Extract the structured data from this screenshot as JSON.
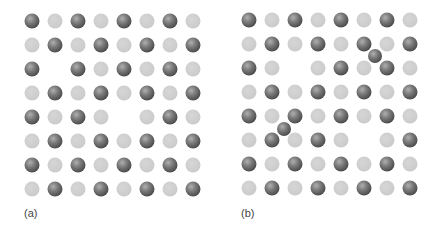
{
  "figure": {
    "colors": {
      "dark_atom": "#555555",
      "light_atom": "#cccccc",
      "background": "#ffffff"
    },
    "grid": {
      "rows": 8,
      "cols": 8,
      "pattern": "checkerboard: dark where (row+col) even"
    },
    "panels": [
      {
        "id": "a",
        "label": "(a)",
        "origin": [
          32,
          21
        ],
        "spacing": [
          23,
          24
        ],
        "vacancies": [
          [
            2,
            1
          ],
          [
            4,
            4
          ]
        ],
        "interstitials": [],
        "label_pos": [
          24,
          207
        ]
      },
      {
        "id": "b",
        "label": "(b)",
        "origin": [
          249,
          20
        ],
        "spacing": [
          23,
          24
        ],
        "vacancies": [
          [
            2,
            2
          ],
          [
            5,
            5
          ]
        ],
        "interstitials": [
          [
            375,
            56
          ],
          [
            284,
            129
          ]
        ],
        "label_pos": [
          241,
          207
        ]
      }
    ]
  }
}
